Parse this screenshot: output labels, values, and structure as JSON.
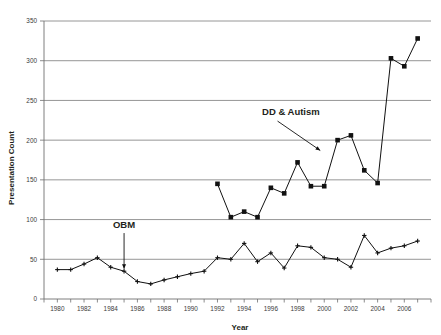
{
  "chart_data": {
    "type": "line",
    "title": "",
    "xlabel": "Year",
    "ylabel": "Presentation Count",
    "xlim": [
      1979,
      2008
    ],
    "ylim": [
      0,
      350
    ],
    "yticks": [
      0,
      50,
      100,
      150,
      200,
      250,
      300,
      350
    ],
    "xticks": [
      1980,
      1982,
      1984,
      1986,
      1988,
      1990,
      1992,
      1994,
      1996,
      1998,
      2000,
      2002,
      2004,
      2006
    ],
    "xtick_labels": [
      "1980",
      "1982",
      "1984",
      "1986",
      "1988",
      "1990",
      "1992",
      "1994",
      "1996",
      "1998",
      "2000",
      "2002",
      "2004",
      "2006"
    ],
    "ytick_labels": [
      "0",
      "50",
      "100",
      "150",
      "200",
      "250",
      "300",
      "350"
    ],
    "grid": "horizontal",
    "legend_position": "inline-annotation",
    "series": [
      {
        "name": "OBM",
        "marker": "cross",
        "x": [
          1980,
          1981,
          1982,
          1983,
          1984,
          1985,
          1986,
          1987,
          1988,
          1989,
          1990,
          1991,
          1992,
          1993,
          1994,
          1995,
          1996,
          1997,
          1998,
          1999,
          2000,
          2001,
          2002,
          2003,
          2004,
          2005,
          2006,
          2007
        ],
        "values": [
          37,
          37,
          44,
          52,
          40,
          35,
          22,
          19,
          24,
          28,
          32,
          35,
          52,
          50,
          70,
          47,
          58,
          39,
          67,
          65,
          52,
          50,
          40,
          80,
          58,
          64,
          67,
          73
        ]
      },
      {
        "name": "DD & Autism",
        "marker": "square",
        "x": [
          1992,
          1993,
          1994,
          1995,
          1996,
          1997,
          1998,
          1999,
          2000,
          2001,
          2002,
          2003,
          2004,
          2005,
          2006,
          2007
        ],
        "values": [
          145,
          103,
          110,
          103,
          140,
          133,
          172,
          142,
          142,
          200,
          206,
          162,
          146,
          303,
          293,
          328
        ]
      }
    ],
    "annotations": [
      {
        "text": "OBM",
        "x": 1985,
        "y": 90
      },
      {
        "text": "DD & Autism",
        "x": 1997.5,
        "y": 232
      }
    ]
  }
}
